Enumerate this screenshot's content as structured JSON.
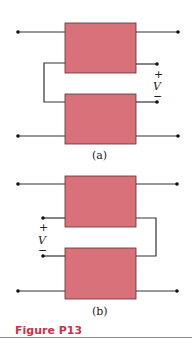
{
  "figure": {
    "caption": "Figure P13",
    "caption_color": "#c8334a",
    "box_color": "#d9717b"
  },
  "subfigures": [
    {
      "label": "(a)",
      "polarity_plus": "+",
      "voltage": "V",
      "polarity_minus": "−",
      "voltage_side": "right",
      "connector_side": "left"
    },
    {
      "label": "(b)",
      "polarity_plus": "+",
      "voltage": "V",
      "polarity_minus": "−",
      "voltage_side": "left",
      "connector_side": "right"
    }
  ]
}
